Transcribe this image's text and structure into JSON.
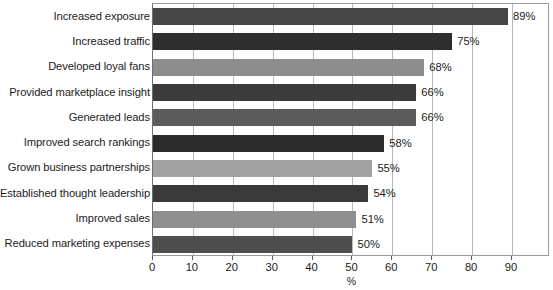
{
  "chart_data": {
    "type": "bar",
    "orientation": "horizontal",
    "title": "",
    "xlabel": "%",
    "ylabel": "",
    "xlim": [
      0,
      90
    ],
    "xticks": [
      0,
      10,
      20,
      30,
      40,
      50,
      60,
      70,
      80,
      90
    ],
    "xtick_labels": [
      "0",
      "10",
      "20",
      "30",
      "40",
      "50",
      "60",
      "70",
      "80",
      "90"
    ],
    "grid": true,
    "grid_axis": "x",
    "legend": "none",
    "categories": [
      "Increased exposure",
      "Increased traffic",
      "Developed loyal fans",
      "Provided marketplace insight",
      "Generated leads",
      "Improved search rankings",
      "Grown business partnerships",
      "Established thought leadership",
      "Improved sales",
      "Reduced marketing expenses"
    ],
    "values": [
      89,
      75,
      68,
      66,
      66,
      58,
      55,
      54,
      51,
      50
    ],
    "data_labels": [
      "89%",
      "75%",
      "68%",
      "66%",
      "66%",
      "58%",
      "55%",
      "54%",
      "51%",
      "50%"
    ],
    "bar_colors": [
      "#464646",
      "#2e2e2e",
      "#8d8d8d",
      "#3b3b3b",
      "#5b5b5b",
      "#2b2b2b",
      "#a2a2a2",
      "#3a3a3a",
      "#8f8f8f",
      "#4e4e4e"
    ],
    "axis_color": "#6e6e6e",
    "gridline_color": "#b8b8b8",
    "background_color": "#ffffff",
    "text_color": "#1c1c1c"
  }
}
